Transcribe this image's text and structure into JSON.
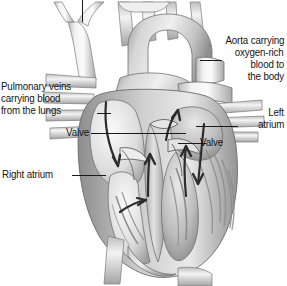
{
  "figure": {
    "style": "grayscale anatomical illustration",
    "background_color": "#ffffff",
    "line_color": "#1a1a1a",
    "text_color": "#141414"
  },
  "labels": {
    "aorta": {
      "name": "aorta-label",
      "lines": [
        "Aorta carrying",
        "oxygen-rich",
        "blood to",
        "the body"
      ],
      "text": "Aorta carrying oxygen-rich blood to the body",
      "align": "right"
    },
    "pulmonary_veins": {
      "name": "pulmonary-veins-label",
      "lines": [
        "Pulmonary veins",
        "carrying blood",
        "from the lungs"
      ],
      "text": "Pulmonary veins carrying blood from the lungs",
      "align": "left"
    },
    "valve_left": {
      "name": "valve-left-label",
      "text": "Valve",
      "align": "right"
    },
    "right_atrium": {
      "name": "right-atrium-label",
      "text": "Right atrium",
      "align": "left"
    },
    "left_atrium": {
      "name": "left-atrium-label",
      "lines": [
        "Left",
        "atrium"
      ],
      "text": "Left atrium",
      "align": "right"
    },
    "valve_right": {
      "name": "valve-right-label",
      "text": "Valve",
      "align": "left"
    }
  },
  "anatomy": {
    "structures": [
      "superior vena cava",
      "brachiocephalic vessels",
      "aortic arch",
      "descending aorta",
      "pulmonary artery",
      "pulmonary veins",
      "right atrium",
      "left atrium",
      "right ventricle",
      "left ventricle",
      "tricuspid valve",
      "mitral valve",
      "interventricular septum",
      "papillary muscles",
      "apex"
    ],
    "flow_arrows": 6
  }
}
